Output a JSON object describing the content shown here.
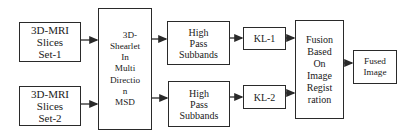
{
  "diagram": {
    "nodes": {
      "mri1": {
        "lines": [
          "3D-MRI",
          "Slices",
          "Set-1"
        ]
      },
      "mri2": {
        "lines": [
          "3D-MRI",
          "Slices",
          "Set-2"
        ]
      },
      "shearlet": {
        "lines": [
          "3D-",
          "Shearlet",
          "In",
          "Multi",
          "Directio",
          "n",
          "MSD"
        ]
      },
      "hp1": {
        "lines": [
          "High",
          "Pass",
          "Subbands"
        ]
      },
      "hp2": {
        "lines": [
          "High",
          "Pass",
          "Subbands"
        ]
      },
      "kl1": {
        "lines": [
          "KL-1"
        ]
      },
      "kl2": {
        "lines": [
          "KL-2"
        ]
      },
      "fusion": {
        "lines": [
          "Fusion",
          "Based",
          "On",
          "Image",
          "Regist",
          "ration"
        ]
      },
      "fused": {
        "lines": [
          "Fused",
          "Image"
        ]
      }
    },
    "edges": [
      {
        "from": "mri1",
        "to": "shearlet"
      },
      {
        "from": "mri2",
        "to": "shearlet"
      },
      {
        "from": "shearlet",
        "to": "hp1"
      },
      {
        "from": "shearlet",
        "to": "hp2"
      },
      {
        "from": "hp1",
        "to": "kl1"
      },
      {
        "from": "hp2",
        "to": "kl2"
      },
      {
        "from": "kl1",
        "to": "fusion"
      },
      {
        "from": "kl2",
        "to": "fusion"
      },
      {
        "from": "fusion",
        "to": "fused"
      }
    ],
    "colors": {
      "stroke": "#2a2a2a",
      "text": "#1a1a1a",
      "background": "#ffffff"
    }
  }
}
